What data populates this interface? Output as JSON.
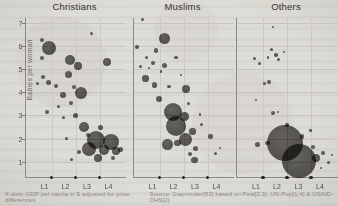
{
  "page": {
    "background_color": "#dedcd6",
    "ink_color": "#3a3935",
    "bubble_color": "#423f3b",
    "axis_color": "#8b8983",
    "gridline_color": "#c9c7c0"
  },
  "chart_data": {
    "type": "scatter",
    "subtype": "bubble-small-multiples",
    "ylabel": "Babies per woman",
    "yticks": [
      7,
      6,
      5,
      4,
      3,
      2,
      1
    ],
    "ylim": [
      0.35,
      7.2
    ],
    "xticks": [
      "L1",
      "L2",
      "L3",
      "L4"
    ],
    "x_boundary_dots_fraction": [
      0.26,
      0.5,
      0.74
    ],
    "x_tick_label_fraction": [
      0.19,
      0.4,
      0.615,
      0.83
    ],
    "grid": "faint horizontal at integers, faint vertical at level boundaries",
    "legend_position": "none",
    "xlabel_note": "X-axis: GDP per capita in $ adjusted for price differences.",
    "source": "Source: Gapminder[53] based on Pew[2,3], UN-Pop[1,4] & USAID-DHS[2]",
    "x_units": "income level position 0-4 (L1-L4 quarters)",
    "y_units": "babies per woman",
    "r_units": "bubble radius in px (population size)",
    "panels": [
      {
        "name": "Christians",
        "bubbles": [
          {
            "x": 0.94,
            "y": 5.9,
            "r": 7
          },
          {
            "x": 0.65,
            "y": 6.25,
            "r": 2
          },
          {
            "x": 0.65,
            "y": 5.47,
            "r": 2
          },
          {
            "x": 1.78,
            "y": 5.4,
            "r": 5
          },
          {
            "x": 2.1,
            "y": 5.14,
            "r": 4
          },
          {
            "x": 2.64,
            "y": 6.55,
            "r": 1.5
          },
          {
            "x": 3.26,
            "y": 5.32,
            "r": 4
          },
          {
            "x": 1.7,
            "y": 4.76,
            "r": 3.5
          },
          {
            "x": 0.7,
            "y": 4.66,
            "r": 2
          },
          {
            "x": 0.46,
            "y": 4.36,
            "r": 1.5
          },
          {
            "x": 0.93,
            "y": 4.42,
            "r": 2.5
          },
          {
            "x": 1.22,
            "y": 4.28,
            "r": 2
          },
          {
            "x": 1.93,
            "y": 4.23,
            "r": 2
          },
          {
            "x": 1.5,
            "y": 3.89,
            "r": 3
          },
          {
            "x": 2.22,
            "y": 3.98,
            "r": 6
          },
          {
            "x": 1.82,
            "y": 3.54,
            "r": 2
          },
          {
            "x": 1.3,
            "y": 3.37,
            "r": 1.5
          },
          {
            "x": 0.86,
            "y": 3.16,
            "r": 2
          },
          {
            "x": 2.0,
            "y": 2.98,
            "r": 2.5
          },
          {
            "x": 1.5,
            "y": 2.9,
            "r": 1.5
          },
          {
            "x": 2.33,
            "y": 2.5,
            "r": 5
          },
          {
            "x": 3.0,
            "y": 2.47,
            "r": 2.5
          },
          {
            "x": 2.5,
            "y": 2.16,
            "r": 2
          },
          {
            "x": 1.62,
            "y": 2.03,
            "r": 1.5
          },
          {
            "x": 2.81,
            "y": 1.95,
            "r": 9
          },
          {
            "x": 3.4,
            "y": 1.86,
            "r": 8
          },
          {
            "x": 2.53,
            "y": 1.56,
            "r": 7
          },
          {
            "x": 3.13,
            "y": 1.52,
            "r": 5
          },
          {
            "x": 3.6,
            "y": 1.47,
            "r": 4
          },
          {
            "x": 2.89,
            "y": 1.17,
            "r": 4
          },
          {
            "x": 2.13,
            "y": 1.43,
            "r": 2
          },
          {
            "x": 1.84,
            "y": 1.1,
            "r": 1.5
          },
          {
            "x": 3.49,
            "y": 1.15,
            "r": 2
          },
          {
            "x": 3.81,
            "y": 1.55,
            "r": 2.5
          }
        ]
      },
      {
        "name": "Muslims",
        "bubbles": [
          {
            "x": 0.36,
            "y": 7.15,
            "r": 1.5
          },
          {
            "x": 1.23,
            "y": 6.3,
            "r": 5.5
          },
          {
            "x": 0.15,
            "y": 5.93,
            "r": 2
          },
          {
            "x": 0.9,
            "y": 5.8,
            "r": 2.3
          },
          {
            "x": 1.7,
            "y": 5.5,
            "r": 1.8
          },
          {
            "x": 0.5,
            "y": 5.5,
            "r": 1.5
          },
          {
            "x": 0.79,
            "y": 5.28,
            "r": 2
          },
          {
            "x": 1.23,
            "y": 5.15,
            "r": 2.5
          },
          {
            "x": 0.29,
            "y": 5.1,
            "r": 1.5
          },
          {
            "x": 0.6,
            "y": 5.05,
            "r": 1
          },
          {
            "x": 0.49,
            "y": 4.6,
            "r": 3.3
          },
          {
            "x": 0.85,
            "y": 4.32,
            "r": 2.7
          },
          {
            "x": 1.43,
            "y": 4.25,
            "r": 1.8
          },
          {
            "x": 2.09,
            "y": 4.15,
            "r": 4
          },
          {
            "x": 1.1,
            "y": 4.9,
            "r": 1.2
          },
          {
            "x": 1.9,
            "y": 4.75,
            "r": 1.2
          },
          {
            "x": 1.01,
            "y": 3.72,
            "r": 3
          },
          {
            "x": 1.57,
            "y": 3.17,
            "r": 9
          },
          {
            "x": 2.03,
            "y": 2.95,
            "r": 4.3
          },
          {
            "x": 2.2,
            "y": 3.5,
            "r": 1.5
          },
          {
            "x": 2.65,
            "y": 3.05,
            "r": 1.2
          },
          {
            "x": 1.68,
            "y": 2.55,
            "r": 10
          },
          {
            "x": 2.36,
            "y": 2.3,
            "r": 3.3
          },
          {
            "x": 2.71,
            "y": 2.6,
            "r": 1.5
          },
          {
            "x": 3.07,
            "y": 2.09,
            "r": 2.3
          },
          {
            "x": 2.09,
            "y": 1.95,
            "r": 6.5
          },
          {
            "x": 1.37,
            "y": 1.73,
            "r": 5.5
          },
          {
            "x": 1.77,
            "y": 1.81,
            "r": 3.3
          },
          {
            "x": 2.48,
            "y": 1.59,
            "r": 2.7
          },
          {
            "x": 2.44,
            "y": 1.09,
            "r": 3.3
          },
          {
            "x": 2.27,
            "y": 1.35,
            "r": 2
          },
          {
            "x": 3.28,
            "y": 1.37,
            "r": 1.5
          },
          {
            "x": 3.47,
            "y": 1.59,
            "r": 1.2
          }
        ]
      },
      {
        "name": "Others",
        "bubbles": [
          {
            "x": 1.43,
            "y": 6.8,
            "r": 1
          },
          {
            "x": 1.36,
            "y": 5.83,
            "r": 1.5
          },
          {
            "x": 1.55,
            "y": 5.61,
            "r": 1.8
          },
          {
            "x": 1.24,
            "y": 5.5,
            "r": 1.2
          },
          {
            "x": 1.65,
            "y": 5.43,
            "r": 1.5
          },
          {
            "x": 1.88,
            "y": 5.74,
            "r": 1
          },
          {
            "x": 0.69,
            "y": 5.47,
            "r": 1.5
          },
          {
            "x": 0.89,
            "y": 5.25,
            "r": 1.5
          },
          {
            "x": 1.09,
            "y": 4.39,
            "r": 1.5
          },
          {
            "x": 1.28,
            "y": 4.45,
            "r": 2
          },
          {
            "x": 0.76,
            "y": 3.67,
            "r": 1.2
          },
          {
            "x": 1.45,
            "y": 3.11,
            "r": 2.2
          },
          {
            "x": 1.64,
            "y": 3.14,
            "r": 1.2
          },
          {
            "x": 1.99,
            "y": 2.6,
            "r": 1.8
          },
          {
            "x": 2.6,
            "y": 2.09,
            "r": 2.2
          },
          {
            "x": 2.95,
            "y": 2.35,
            "r": 1.3
          },
          {
            "x": 1.93,
            "y": 1.81,
            "r": 18
          },
          {
            "x": 2.49,
            "y": 1.06,
            "r": 17
          },
          {
            "x": 0.83,
            "y": 1.73,
            "r": 2.5
          },
          {
            "x": 1.23,
            "y": 1.81,
            "r": 2.3
          },
          {
            "x": 3.03,
            "y": 1.66,
            "r": 2
          },
          {
            "x": 3.16,
            "y": 1.16,
            "r": 4
          },
          {
            "x": 3.44,
            "y": 1.4,
            "r": 2
          },
          {
            "x": 3.36,
            "y": 0.74,
            "r": 1.2
          },
          {
            "x": 3.64,
            "y": 0.96,
            "r": 1.5
          },
          {
            "x": 3.8,
            "y": 1.3,
            "r": 1.2
          }
        ]
      }
    ]
  }
}
